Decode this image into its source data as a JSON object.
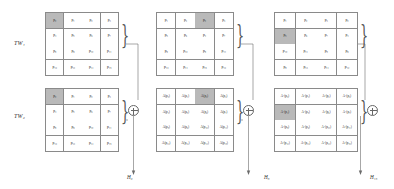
{
  "figure": {
    "type": "feature-aggregation-diagram",
    "row_labels": [
      {
        "id": "tw1",
        "text": "TW₁"
      },
      {
        "id": "tw2",
        "text": "TW₂"
      }
    ],
    "operator_symbol": "⊕",
    "brace_symbol": "}",
    "grid_shape": [
      4,
      4
    ],
    "stages": [
      {
        "id": "stage-0",
        "output_label": "H₀",
        "top_grid": {
          "name": "tw1-feature-map",
          "highlight_index": 0,
          "cells": [
            "p₀",
            "p₁",
            "p₂",
            "p₃",
            "p₄",
            "p₅",
            "p₆",
            "p₇",
            "p₈",
            "p₉",
            "p₁₀",
            "p₁₁",
            "p₁₂",
            "p₁₃",
            "p₁₄",
            "p₁₅"
          ]
        },
        "bottom_grid": {
          "name": "tw2-feature-map",
          "highlight_index": 0,
          "cells": [
            "p₀",
            "p₁",
            "p₂",
            "p₃",
            "p₄",
            "p₅",
            "p₆",
            "p₇",
            "p₈",
            "p₉",
            "p₁₀",
            "p₁₁",
            "p₁₂",
            "p₁₃",
            "p₁₄",
            "p₁₅"
          ]
        }
      },
      {
        "id": "stage-1",
        "output_label": "H₈",
        "top_grid": {
          "name": "stage1-position-map",
          "highlight_index": 2,
          "cells": [
            "p₁",
            "p₂",
            "p₀",
            "p₃",
            "p₅",
            "p₆",
            "p₄",
            "p₇",
            "p₉",
            "p₁₀",
            "p₈",
            "p₁₁",
            "p₁₃",
            "p₁₄",
            "p₁₅",
            "p₁₂"
          ]
        },
        "bottom_grid": {
          "name": "stage1-attention-map",
          "highlight_index": 2,
          "cells": [
            "A(p₀)",
            "A(p₁)",
            "A(p₂)",
            "A(p₃)",
            "A(p₄)",
            "A(p₅)",
            "A(p₆)",
            "A(p₇)",
            "A(p₈)",
            "A(p₉)",
            "A(p₁₀)",
            "A(p₁₁)",
            "A(p₁₂)",
            "A(p₁₃)",
            "A(p₁₄)",
            "A(p₁₅)"
          ]
        }
      },
      {
        "id": "stage-2",
        "output_label": "H₁₅",
        "top_grid": {
          "name": "stage2-position-map",
          "highlight_index": 4,
          "cells": [
            "p₁",
            "p₂",
            "p₃",
            "p₀",
            "p₅",
            "p₆",
            "p₇",
            "p₄",
            "p₁₀",
            "p₁₁",
            "p₈",
            "p₉",
            "p₈",
            "p₁₃",
            "p₁₄",
            "p₁₂"
          ]
        },
        "bottom_grid": {
          "name": "stage2-attention-map",
          "highlight_index": 4,
          "cells": [
            "Aᴸ(p₀)",
            "Aᴸ(p₁)",
            "Aᴸ(p₂)",
            "Aᴸ(p₃)",
            "Aᴸ(p₄)",
            "Aᴸ(p₅)",
            "Aᴸ(p₆)",
            "Aᴸ(p₇)",
            "Aᴸ(p₈)",
            "Aᴸ(p₉)",
            "Aᴸ(p₁₀)",
            "Aᴸ(p₁₁)",
            "Aᴸ(p₁₂)",
            "Aᴸ(p₁₃)",
            "Aᴸ(p₁₄)",
            "Aᴸ(p₁₅)"
          ]
        }
      }
    ]
  }
}
